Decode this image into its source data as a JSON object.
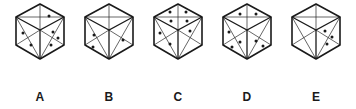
{
  "puzzle": {
    "kind": "spatial-reasoning-dice-figures",
    "stroke_color": "#1a1a1a",
    "dot_color": "#1a1a1a",
    "face_fill": "#ffffff",
    "background": "#ffffff",
    "cubes": [
      {
        "label": "A",
        "name": "cube-a",
        "faces": {
          "top": {
            "dots": 1,
            "positions": [
              [
                0.62,
                0.45
              ]
            ]
          },
          "left": {
            "dots": 2,
            "positions": [
              [
                0.28,
                0.26
              ],
              [
                0.6,
                0.6
              ]
            ]
          },
          "right": {
            "dots": 3,
            "positions": [
              [
                0.3,
                0.3
              ],
              [
                0.66,
                0.45
              ],
              [
                0.45,
                0.72
              ]
            ]
          }
        }
      },
      {
        "label": "B",
        "name": "cube-b",
        "faces": {
          "top": {
            "dots": 0,
            "positions": []
          },
          "left": {
            "dots": 2,
            "positions": [
              [
                0.34,
                0.32
              ],
              [
                0.32,
                0.72
              ]
            ]
          },
          "right": {
            "dots": 1,
            "positions": [
              [
                0.62,
                0.5
              ]
            ]
          }
        }
      },
      {
        "label": "C",
        "name": "cube-c",
        "faces": {
          "top": {
            "dots": 4,
            "positions": [
              [
                0.33,
                0.32
              ],
              [
                0.66,
                0.32
              ],
              [
                0.33,
                0.62
              ],
              [
                0.66,
                0.62
              ]
            ]
          },
          "left": {
            "dots": 2,
            "positions": [
              [
                0.26,
                0.3
              ],
              [
                0.55,
                0.62
              ]
            ]
          },
          "right": {
            "dots": 1,
            "positions": [
              [
                0.3,
                0.3
              ]
            ]
          }
        }
      },
      {
        "label": "D",
        "name": "cube-d",
        "faces": {
          "top": {
            "dots": 2,
            "positions": [
              [
                0.34,
                0.4
              ],
              [
                0.68,
                0.38
              ]
            ]
          },
          "left": {
            "dots": 3,
            "positions": [
              [
                0.24,
                0.3
              ],
              [
                0.58,
                0.55
              ],
              [
                0.32,
                0.74
              ]
            ]
          },
          "right": {
            "dots": 2,
            "positions": [
              [
                0.34,
                0.52
              ],
              [
                0.64,
                0.72
              ]
            ]
          }
        }
      },
      {
        "label": "E",
        "name": "cube-e",
        "faces": {
          "top": {
            "dots": 0,
            "positions": []
          },
          "left": {
            "dots": 0,
            "positions": []
          },
          "right": {
            "dots": 3,
            "positions": [
              [
                0.34,
                0.28
              ],
              [
                0.66,
                0.44
              ],
              [
                0.48,
                0.7
              ]
            ]
          }
        }
      }
    ]
  }
}
